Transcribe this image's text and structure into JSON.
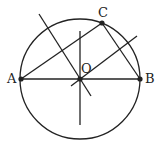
{
  "diagram": {
    "type": "geometry",
    "circle": {
      "center": "O",
      "cx": 80,
      "cy": 79,
      "r": 60
    },
    "points": {
      "A": {
        "label": "A",
        "x": 21,
        "y": 79,
        "lx": 7,
        "ly": 83
      },
      "B": {
        "label": "B",
        "x": 140,
        "y": 79,
        "lx": 145,
        "ly": 83
      },
      "C": {
        "label": "C",
        "x": 102,
        "y": 23,
        "lx": 98,
        "ly": 17
      },
      "O": {
        "label": "O",
        "x": 80,
        "y": 79,
        "lx": 81,
        "ly": 73
      }
    },
    "segments": [
      {
        "name": "AB",
        "x1": 21,
        "y1": 79,
        "x2": 140,
        "y2": 79
      },
      {
        "name": "AC",
        "x1": 21,
        "y1": 79,
        "x2": 102,
        "y2": 23
      },
      {
        "name": "BC",
        "x1": 102,
        "y1": 23,
        "x2": 140,
        "y2": 79
      },
      {
        "name": "vertical-line",
        "x1": 80,
        "y1": 31,
        "x2": 80,
        "y2": 125
      },
      {
        "name": "bisector-ac",
        "x1": 39,
        "y1": 14,
        "x2": 91,
        "y2": 96
      },
      {
        "name": "bisector-bc",
        "x1": 71,
        "y1": 86,
        "x2": 137,
        "y2": 36
      }
    ],
    "stroke_color": "#222222"
  }
}
